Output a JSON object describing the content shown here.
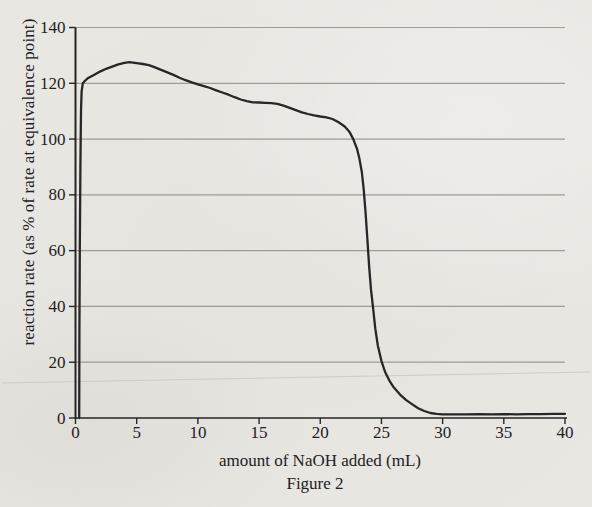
{
  "figure": {
    "caption": "Figure 2"
  },
  "colors": {
    "background": "#e9e7e2",
    "grid": "#96948d",
    "axis": "#262626",
    "curve": "#272727",
    "text": "#22211f",
    "scan_artifact": "#c9c7c1"
  },
  "chart_data": {
    "type": "line",
    "title": "",
    "xlabel": "amount of NaOH added (mL)",
    "ylabel": "reaction rate (as % of rate at equivalence point)",
    "xlim": [
      0,
      40
    ],
    "ylim": [
      0,
      140
    ],
    "xticks": [
      0,
      5,
      10,
      15,
      20,
      25,
      30,
      35,
      40
    ],
    "yticks": [
      0,
      20,
      40,
      60,
      80,
      100,
      120,
      140
    ],
    "grid": "horizontal-only",
    "legend": "none",
    "series": [
      {
        "name": "reaction rate",
        "points": [
          [
            0.3,
            0
          ],
          [
            0.32,
            30
          ],
          [
            0.35,
            60
          ],
          [
            0.4,
            90
          ],
          [
            0.45,
            110
          ],
          [
            0.5,
            117
          ],
          [
            0.6,
            120
          ],
          [
            0.8,
            121
          ],
          [
            1,
            121.8
          ],
          [
            1.5,
            123
          ],
          [
            2,
            124.2
          ],
          [
            2.5,
            125.2
          ],
          [
            3,
            126
          ],
          [
            3.5,
            126.8
          ],
          [
            4,
            127.3
          ],
          [
            4.4,
            127.6
          ],
          [
            5,
            127.2
          ],
          [
            5.5,
            126.9
          ],
          [
            6,
            126.5
          ],
          [
            6.5,
            125.7
          ],
          [
            7,
            124.8
          ],
          [
            7.5,
            123.9
          ],
          [
            8,
            123
          ],
          [
            8.5,
            122
          ],
          [
            9,
            121.1
          ],
          [
            9.5,
            120.3
          ],
          [
            10,
            119.6
          ],
          [
            10.5,
            119
          ],
          [
            11,
            118.3
          ],
          [
            11.5,
            117.5
          ],
          [
            12,
            116.7
          ],
          [
            12.5,
            115.9
          ],
          [
            13,
            115
          ],
          [
            13.5,
            114.2
          ],
          [
            14,
            113.6
          ],
          [
            14.5,
            113.2
          ],
          [
            15,
            113.1
          ],
          [
            15.5,
            113
          ],
          [
            16,
            112.9
          ],
          [
            16.5,
            112.6
          ],
          [
            17,
            112
          ],
          [
            17.5,
            111.2
          ],
          [
            18,
            110.4
          ],
          [
            18.5,
            109.6
          ],
          [
            19,
            109
          ],
          [
            19.5,
            108.5
          ],
          [
            20,
            108.1
          ],
          [
            20.5,
            107.8
          ],
          [
            21,
            107.2
          ],
          [
            21.5,
            106
          ],
          [
            22,
            104.5
          ],
          [
            22.4,
            102.5
          ],
          [
            22.7,
            100
          ],
          [
            23,
            96.5
          ],
          [
            23.2,
            93
          ],
          [
            23.4,
            88
          ],
          [
            23.55,
            82
          ],
          [
            23.7,
            74
          ],
          [
            23.85,
            64
          ],
          [
            24,
            54
          ],
          [
            24.15,
            46
          ],
          [
            24.3,
            40
          ],
          [
            24.5,
            32
          ],
          [
            24.7,
            26
          ],
          [
            25,
            20.5
          ],
          [
            25.3,
            16.5
          ],
          [
            25.7,
            13
          ],
          [
            26,
            11
          ],
          [
            26.5,
            8.5
          ],
          [
            27,
            6.5
          ],
          [
            27.5,
            5
          ],
          [
            28,
            3.5
          ],
          [
            28.5,
            2.5
          ],
          [
            29,
            1.8
          ],
          [
            29.5,
            1.5
          ],
          [
            30,
            1.3
          ],
          [
            31,
            1.3
          ],
          [
            32,
            1.3
          ],
          [
            33,
            1.4
          ],
          [
            34,
            1.3
          ],
          [
            35,
            1.4
          ],
          [
            36,
            1.3
          ],
          [
            37,
            1.4
          ],
          [
            38,
            1.4
          ],
          [
            39,
            1.5
          ],
          [
            40,
            1.5
          ]
        ]
      }
    ]
  }
}
